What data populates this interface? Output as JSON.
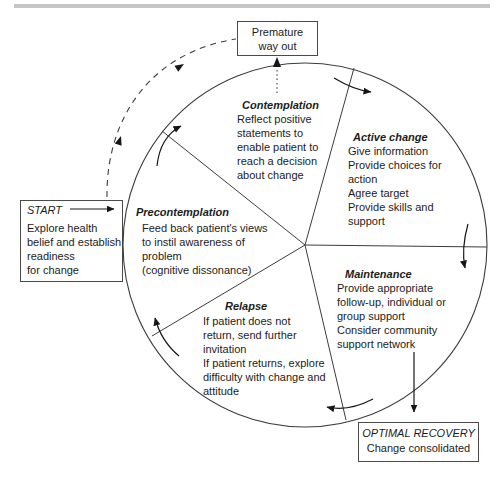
{
  "diagram": {
    "name": "stages-of-change-cycle",
    "top_rule_color": "#c6c6c6",
    "ink_color": "#1c1c1c",
    "line_color": "#3c3c3c"
  },
  "boxes": {
    "premature": {
      "lines": [
        "Premature",
        "way out"
      ]
    },
    "start": {
      "label": "START",
      "lines": [
        "Explore health",
        "belief and establish",
        "readiness",
        "for change"
      ]
    },
    "optimal": {
      "title": "OPTIMAL RECOVERY",
      "subtitle": "Change consolidated"
    }
  },
  "stages": [
    {
      "title": "Contemplation",
      "lines": [
        "Reflect positive",
        "statements to",
        "enable patient to",
        "reach a decision",
        "about change"
      ]
    },
    {
      "title": "Active change",
      "lines": [
        "Give information",
        "Provide choices for",
        "action",
        "Agree target",
        "Provide skills and",
        "support"
      ]
    },
    {
      "title": "Maintenance",
      "lines": [
        "Provide appropriate",
        "follow-up, individual or",
        "group support",
        "Consider community",
        "support network"
      ]
    },
    {
      "title": "Relapse",
      "lines": [
        "If patient does not",
        "return, send further",
        "invitation",
        "If patient returns, explore",
        "difficulty with change and",
        "attitude"
      ]
    },
    {
      "title": "Precontemplation",
      "lines": [
        "Feed back patient's views",
        "to instil awareness of",
        "problem",
        "(cognitive dissonance)"
      ]
    }
  ]
}
